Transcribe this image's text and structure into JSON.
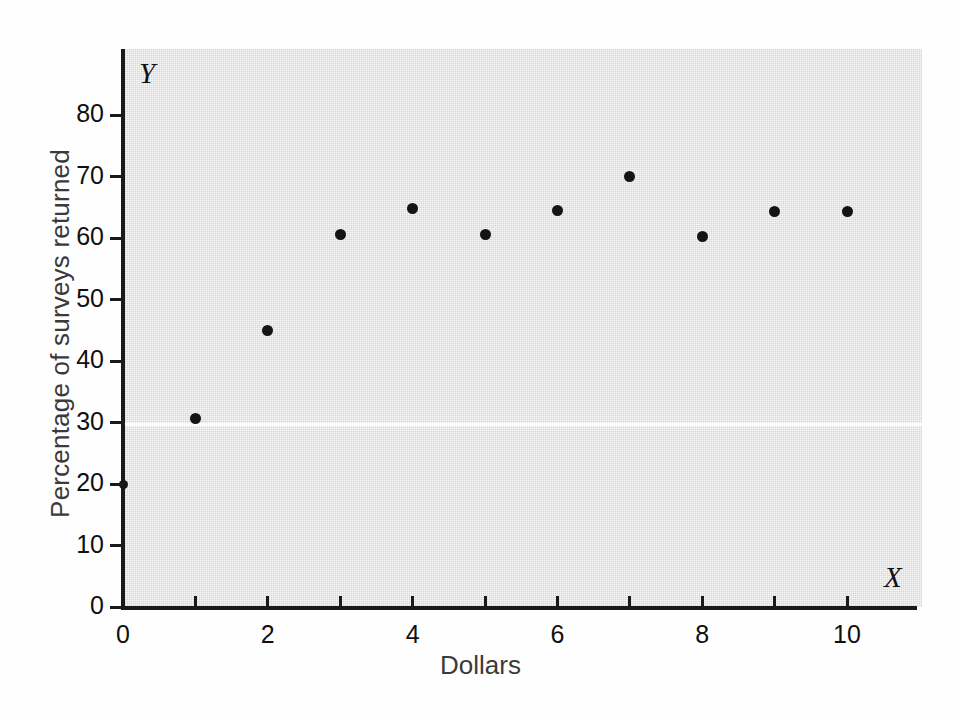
{
  "chart_data": {
    "type": "scatter",
    "title": "",
    "xlabel": "Dollars",
    "ylabel": "Percentage of surveys returned",
    "x_axis_letter": "X",
    "y_axis_letter": "Y",
    "xlim": [
      0,
      11
    ],
    "ylim": [
      0,
      88
    ],
    "grid": false,
    "legend": null,
    "x_ticks": [
      0,
      1,
      2,
      3,
      4,
      5,
      6,
      7,
      8,
      9,
      10
    ],
    "x_tick_labels": [
      "0",
      "",
      "2",
      "",
      "4",
      "",
      "6",
      "",
      "8",
      "",
      "10"
    ],
    "y_ticks": [
      0,
      10,
      20,
      30,
      40,
      50,
      60,
      70,
      80
    ],
    "y_tick_labels": [
      "0",
      "10",
      "20",
      "30",
      "40",
      "50",
      "60",
      "70",
      "80"
    ],
    "x": [
      1,
      2,
      3,
      4,
      5,
      6,
      7,
      8,
      9,
      10
    ],
    "values": [
      30.7,
      45.0,
      60.5,
      64.8,
      60.5,
      64.5,
      70.0,
      60.2,
      64.3,
      64.3
    ],
    "points": [
      {
        "x": 1,
        "y": 30.7
      },
      {
        "x": 2,
        "y": 45.0
      },
      {
        "x": 3,
        "y": 60.5
      },
      {
        "x": 4,
        "y": 64.8
      },
      {
        "x": 5,
        "y": 60.5
      },
      {
        "x": 6,
        "y": 64.5
      },
      {
        "x": 7,
        "y": 70.0
      },
      {
        "x": 8,
        "y": 60.2
      },
      {
        "x": 9,
        "y": 64.3
      },
      {
        "x": 10,
        "y": 64.3
      }
    ],
    "marker": "filled-circle",
    "marker_color": "#141414",
    "plot_background": "#d5d5d5",
    "figure_background": "#ffffff",
    "axis_color": "#1a1a1a"
  }
}
